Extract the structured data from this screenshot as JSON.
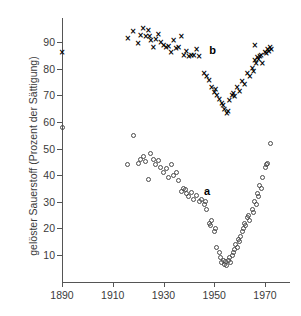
{
  "chart_data": {
    "type": "scatter",
    "title": "",
    "xlabel": "",
    "ylabel": "gelöster Sauerstoff (Prozent der Sättigung)",
    "xlim": [
      1885,
      1975
    ],
    "ylim": [
      0,
      97
    ],
    "xticks": [
      1890,
      1910,
      1930,
      1950,
      1970
    ],
    "xtick_labels": [
      "1890",
      "1910",
      "1930",
      "1950",
      "1970"
    ],
    "yticks": [
      10,
      20,
      30,
      40,
      50,
      60,
      70,
      80,
      90
    ],
    "ytick_labels": [
      "10",
      "20",
      "30",
      "40",
      "50",
      "60",
      "70",
      "80",
      "90"
    ],
    "grid": false,
    "legend": "inline-annotations",
    "annotations": [
      {
        "text": "a",
        "x": 1946,
        "y": 36
      },
      {
        "text": "b",
        "x": 1948,
        "y": 89
      }
    ],
    "series": [
      {
        "name": "b",
        "marker": "x",
        "color": "#000000",
        "points": [
          [
            1890,
            86
          ],
          [
            1916,
            91.5
          ],
          [
            1918,
            94
          ],
          [
            1920,
            89.5
          ],
          [
            1921,
            92.5
          ],
          [
            1922,
            95
          ],
          [
            1923,
            92
          ],
          [
            1924,
            94.5
          ],
          [
            1924.5,
            92
          ],
          [
            1925,
            90.5
          ],
          [
            1926,
            88
          ],
          [
            1927,
            91
          ],
          [
            1928,
            93
          ],
          [
            1929,
            90
          ],
          [
            1930,
            88.5
          ],
          [
            1931,
            88
          ],
          [
            1932,
            88.2
          ],
          [
            1933,
            86
          ],
          [
            1934,
            90.5
          ],
          [
            1935,
            87.5
          ],
          [
            1936,
            88
          ],
          [
            1937,
            92
          ],
          [
            1938,
            85
          ],
          [
            1939,
            86.5
          ],
          [
            1940,
            84.5
          ],
          [
            1941,
            85
          ],
          [
            1942,
            84.8
          ],
          [
            1943,
            87
          ],
          [
            1944,
            84.5
          ],
          [
            1946,
            78
          ],
          [
            1947,
            77
          ],
          [
            1948,
            75.5
          ],
          [
            1949,
            73
          ],
          [
            1950,
            71
          ],
          [
            1950.5,
            72
          ],
          [
            1951,
            70
          ],
          [
            1952,
            68.5
          ],
          [
            1953,
            67
          ],
          [
            1953.5,
            66
          ],
          [
            1954,
            64.5
          ],
          [
            1955,
            63
          ],
          [
            1955.5,
            64
          ],
          [
            1956,
            68
          ],
          [
            1957,
            70
          ],
          [
            1957.5,
            70.5
          ],
          [
            1958,
            69.5
          ],
          [
            1959,
            73
          ],
          [
            1960,
            71.5
          ],
          [
            1961,
            75
          ],
          [
            1962,
            74
          ],
          [
            1963,
            78
          ],
          [
            1964,
            77
          ],
          [
            1965,
            80
          ],
          [
            1965.5,
            79
          ],
          [
            1966,
            83
          ],
          [
            1966.5,
            82
          ],
          [
            1967,
            84
          ],
          [
            1967.5,
            83.5
          ],
          [
            1968,
            84.5
          ],
          [
            1968.5,
            85
          ],
          [
            1969,
            82
          ],
          [
            1970,
            86
          ],
          [
            1970.5,
            85.5
          ],
          [
            1971,
            87
          ],
          [
            1971.5,
            86.5
          ],
          [
            1972,
            88
          ],
          [
            1972.5,
            87
          ],
          [
            1966,
            88.5
          ]
        ]
      },
      {
        "name": "a",
        "marker": "o",
        "color": "#4a4a4a",
        "points": [
          [
            1890,
            58
          ],
          [
            1916,
            44
          ],
          [
            1918,
            55
          ],
          [
            1920,
            44.5
          ],
          [
            1921,
            46
          ],
          [
            1922,
            47
          ],
          [
            1923,
            45
          ],
          [
            1924,
            38.5
          ],
          [
            1925,
            48
          ],
          [
            1926,
            46
          ],
          [
            1927,
            44
          ],
          [
            1928,
            45.5
          ],
          [
            1929,
            43
          ],
          [
            1930,
            41
          ],
          [
            1931,
            42.5
          ],
          [
            1932,
            39
          ],
          [
            1933,
            44
          ],
          [
            1934,
            40
          ],
          [
            1935,
            41
          ],
          [
            1936,
            38
          ],
          [
            1937,
            34
          ],
          [
            1938,
            35
          ],
          [
            1938.5,
            34.5
          ],
          [
            1939,
            33
          ],
          [
            1940,
            32
          ],
          [
            1941,
            33.5
          ],
          [
            1942,
            31
          ],
          [
            1943,
            32.5
          ],
          [
            1944,
            30
          ],
          [
            1945,
            31
          ],
          [
            1946,
            29
          ],
          [
            1946.5,
            30
          ],
          [
            1947,
            27
          ],
          [
            1948,
            22
          ],
          [
            1948.5,
            21
          ],
          [
            1949,
            23
          ],
          [
            1950,
            19
          ],
          [
            1950.5,
            20
          ],
          [
            1951,
            13
          ],
          [
            1952,
            11
          ],
          [
            1952.5,
            9
          ],
          [
            1953,
            7
          ],
          [
            1953.5,
            8
          ],
          [
            1954,
            6.5
          ],
          [
            1954.5,
            7.5
          ],
          [
            1955,
            6
          ],
          [
            1955.5,
            8
          ],
          [
            1956,
            9
          ],
          [
            1956.5,
            7
          ],
          [
            1957,
            10
          ],
          [
            1957.5,
            11
          ],
          [
            1958,
            12
          ],
          [
            1958.5,
            14
          ],
          [
            1959,
            13
          ],
          [
            1959.5,
            16
          ],
          [
            1960,
            15
          ],
          [
            1960.5,
            17
          ],
          [
            1961,
            19
          ],
          [
            1961.5,
            20
          ],
          [
            1962,
            22
          ],
          [
            1962.5,
            21
          ],
          [
            1963,
            24
          ],
          [
            1963.5,
            25
          ],
          [
            1964,
            23
          ],
          [
            1965,
            27
          ],
          [
            1965.5,
            26
          ],
          [
            1966,
            30
          ],
          [
            1966.5,
            29
          ],
          [
            1967,
            33
          ],
          [
            1967.5,
            32
          ],
          [
            1968,
            36
          ],
          [
            1968.5,
            35
          ],
          [
            1969,
            39
          ],
          [
            1970,
            43
          ],
          [
            1970.5,
            44
          ],
          [
            1971,
            44.5
          ],
          [
            1972,
            52
          ]
        ]
      }
    ]
  }
}
